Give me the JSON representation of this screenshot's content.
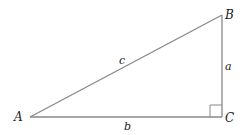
{
  "diagram": {
    "type": "right-triangle",
    "vertices": {
      "A": {
        "label": "A"
      },
      "B": {
        "label": "B"
      },
      "C": {
        "label": "C"
      }
    },
    "sides": {
      "a": {
        "label": "a",
        "between": "B-C"
      },
      "b": {
        "label": "b",
        "between": "A-C"
      },
      "c": {
        "label": "c",
        "between": "A-B"
      }
    },
    "right_angle_at": "C",
    "colors": {
      "stroke": "#888888",
      "text": "#1a1a1a",
      "background": "#ffffff"
    }
  }
}
